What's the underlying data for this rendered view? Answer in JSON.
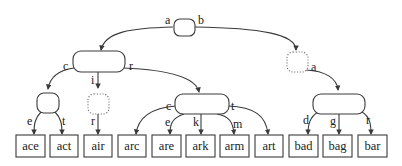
{
  "diagram": {
    "type": "trie",
    "root": {
      "edge_labels": [
        "a",
        "b"
      ]
    },
    "a_node": {
      "edge_labels": [
        "c",
        "i",
        "r"
      ]
    },
    "b_node": {
      "style": "dotted",
      "edge_labels": [
        "a"
      ]
    },
    "ac_node": {
      "edge_labels": [
        "e",
        "t"
      ]
    },
    "ai_node": {
      "style": "dotted",
      "edge_labels": [
        "r"
      ]
    },
    "ar_node": {
      "edge_labels": [
        "c",
        "e",
        "k",
        "m",
        "t"
      ]
    },
    "ba_node": {
      "edge_labels": [
        "d",
        "g",
        "r"
      ]
    },
    "leaves": [
      "ace",
      "act",
      "air",
      "arc",
      "are",
      "ark",
      "arm",
      "art",
      "bad",
      "bag",
      "bar"
    ]
  }
}
